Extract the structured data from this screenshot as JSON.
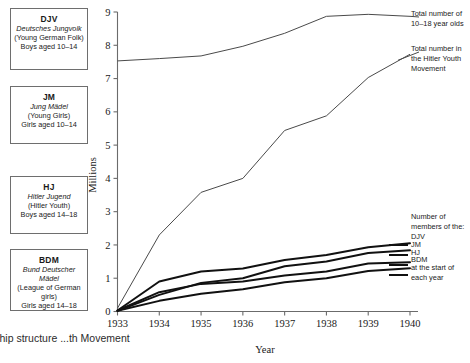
{
  "organisations": [
    {
      "id": "djv",
      "abbr": "DJV",
      "german": "Deutsches Jungvolk",
      "translation": "(Young German Folk)",
      "ages": "Boys aged 10–14"
    },
    {
      "id": "jm",
      "abbr": "JM",
      "german": "Jung Mädel",
      "translation": "(Young Girls)",
      "ages": "Girls aged 10–14"
    },
    {
      "id": "hj",
      "abbr": "HJ",
      "german": "Hitler Jugend",
      "translation": "(Hitler Youth)",
      "ages": "Boys aged 14–18"
    },
    {
      "id": "bdm",
      "abbr": "BDM",
      "german": "Bund Deutscher Mädel",
      "translation": "(League of German girls)",
      "ages": "Girls aged 14–18"
    }
  ],
  "annotations": {
    "total_population": "Total number of 10–18 year olds",
    "total_movement": "Total number in the Hitler Youth Movement"
  },
  "legend": {
    "heading": "Number of members of the:",
    "items": [
      "DJV",
      "JM",
      "HJ",
      "BDM"
    ],
    "footer": "at the start of each year"
  },
  "caption": "...rship structure\n...th Movement",
  "chart_data": {
    "type": "line",
    "title": "",
    "xlabel": "Year",
    "ylabel": "Millions",
    "x": [
      1933,
      1934,
      1935,
      1936,
      1937,
      1938,
      1939,
      1940
    ],
    "xlim": [
      1933,
      1940
    ],
    "ylim": [
      0,
      9
    ],
    "yticks": [
      0,
      1,
      2,
      3,
      4,
      5,
      6,
      7,
      8,
      9
    ],
    "xticks": [
      "1933",
      "1934",
      "1935",
      "1936",
      "1937",
      "1938",
      "1939",
      "1940"
    ],
    "grid": false,
    "legend_position": "right",
    "series": [
      {
        "name": "Total number of 10–18 year olds",
        "style": "thin",
        "values": [
          7.53,
          7.6,
          7.68,
          7.97,
          8.36,
          8.87,
          8.93,
          8.87
        ]
      },
      {
        "name": "Total number in the Hitler Youth Movement",
        "style": "thin",
        "values": [
          0.1,
          2.3,
          3.58,
          4.0,
          5.44,
          5.88,
          7.03,
          7.73
        ]
      },
      {
        "name": "DJV",
        "style": "thick",
        "values": [
          0.03,
          0.9,
          1.2,
          1.29,
          1.55,
          1.7,
          1.93,
          2.05
        ]
      },
      {
        "name": "JM",
        "style": "thick",
        "values": [
          0.02,
          0.5,
          0.86,
          1.0,
          1.36,
          1.5,
          1.76,
          1.84
        ]
      },
      {
        "name": "HJ",
        "style": "thick",
        "values": [
          0.03,
          0.58,
          0.83,
          0.9,
          1.08,
          1.2,
          1.44,
          1.48
        ]
      },
      {
        "name": "BDM",
        "style": "thick",
        "values": [
          0.02,
          0.32,
          0.53,
          0.67,
          0.88,
          1.0,
          1.22,
          1.3
        ]
      }
    ]
  }
}
